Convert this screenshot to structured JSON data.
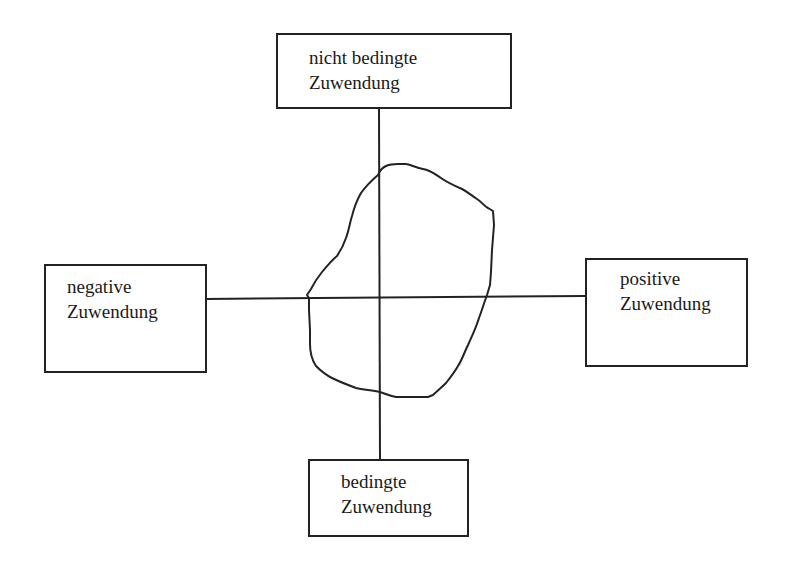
{
  "diagram": {
    "type": "quadrant-diagram",
    "axes": {
      "vertical": {
        "top_label": [
          "nicht bedingte",
          "Zuwendung"
        ],
        "bottom_label": [
          "bedingte",
          "Zuwendung"
        ]
      },
      "horizontal": {
        "left_label": [
          "negative",
          "Zuwendung"
        ],
        "right_label": [
          "positive",
          "Zuwendung"
        ]
      }
    },
    "boxes": {
      "top": {
        "line1": "nicht bedingte",
        "line2": "Zuwendung"
      },
      "left": {
        "line1": "negative",
        "line2": "Zuwendung"
      },
      "right": {
        "line1": "positive",
        "line2": "Zuwendung"
      },
      "bottom": {
        "line1": "bedingte",
        "line2": "Zuwendung"
      }
    },
    "shape": {
      "description": "hand-drawn closed irregular outline centered near axis intersection, extending more into the upper-right quadrant",
      "stroke_color": "#222222"
    },
    "line_color": "#222222"
  }
}
